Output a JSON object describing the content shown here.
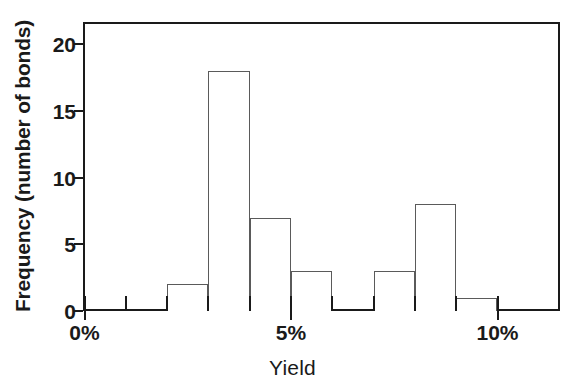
{
  "chart_data": {
    "type": "bar",
    "subtype": "histogram",
    "title": "",
    "xlabel": "Yield",
    "ylabel": "Frequency (number of bonds)",
    "xlim": [
      0,
      11.5
    ],
    "ylim": [
      0,
      21.7
    ],
    "grid": false,
    "legend": null,
    "bin_width": 1,
    "bin_unit": "%",
    "categories": [
      "0%-1%",
      "1%-2%",
      "2%-3%",
      "3%-4%",
      "4%-5%",
      "5%-6%",
      "6%-7%",
      "7%-8%",
      "8%-9%",
      "9%-10%",
      "10%-11%"
    ],
    "bin_starts": [
      0,
      1,
      2,
      3,
      4,
      5,
      6,
      7,
      8,
      9,
      10
    ],
    "values": [
      0,
      0,
      2,
      18,
      7,
      3,
      0,
      3,
      8,
      1,
      0
    ],
    "bars": [
      {
        "bin_start": 2,
        "bin_end": 3,
        "label": "2%-3%",
        "value": 2
      },
      {
        "bin_start": 3,
        "bin_end": 4,
        "label": "3%-4%",
        "value": 18
      },
      {
        "bin_start": 4,
        "bin_end": 5,
        "label": "4%-5%",
        "value": 7
      },
      {
        "bin_start": 5,
        "bin_end": 6,
        "label": "5%-6%",
        "value": 3
      },
      {
        "bin_start": 7,
        "bin_end": 8,
        "label": "7%-8%",
        "value": 3
      },
      {
        "bin_start": 8,
        "bin_end": 9,
        "label": "8%-9%",
        "value": 8
      },
      {
        "bin_start": 9,
        "bin_end": 10,
        "label": "9%-10%",
        "value": 1
      }
    ],
    "total_count": 42,
    "x_ticks": [
      {
        "value": 0,
        "label": "0%",
        "major": true
      },
      {
        "value": 1,
        "label": "",
        "major": false
      },
      {
        "value": 2,
        "label": "",
        "major": false
      },
      {
        "value": 3,
        "label": "",
        "major": false
      },
      {
        "value": 4,
        "label": "",
        "major": false
      },
      {
        "value": 5,
        "label": "5%",
        "major": true
      },
      {
        "value": 6,
        "label": "",
        "major": false
      },
      {
        "value": 7,
        "label": "",
        "major": false
      },
      {
        "value": 8,
        "label": "",
        "major": false
      },
      {
        "value": 9,
        "label": "",
        "major": false
      },
      {
        "value": 10,
        "label": "10%",
        "major": true
      }
    ],
    "y_ticks": [
      {
        "value": 0,
        "label": "0"
      },
      {
        "value": 5,
        "label": "5"
      },
      {
        "value": 10,
        "label": "10"
      },
      {
        "value": 15,
        "label": "15"
      },
      {
        "value": 20,
        "label": "20"
      }
    ],
    "colors": {
      "bar_fill": "#ffffff",
      "bar_stroke": "#5a5a5a",
      "axis": "#1a1a1a",
      "text": "#1a1a1a",
      "background": "#ffffff"
    }
  }
}
